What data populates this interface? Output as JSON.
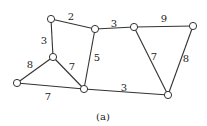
{
  "graph": {
    "caption": "(a)",
    "nodes": [
      {
        "id": "A"
      },
      {
        "id": "B"
      },
      {
        "id": "C"
      },
      {
        "id": "D"
      },
      {
        "id": "E"
      },
      {
        "id": "F"
      },
      {
        "id": "G"
      },
      {
        "id": "H"
      }
    ],
    "edges": [
      {
        "from": "A",
        "to": "B",
        "weight": "2"
      },
      {
        "from": "A",
        "to": "C",
        "weight": "3"
      },
      {
        "from": "B",
        "to": "F",
        "weight": "3"
      },
      {
        "from": "B",
        "to": "E",
        "weight": "5"
      },
      {
        "from": "C",
        "to": "D",
        "weight": "8"
      },
      {
        "from": "C",
        "to": "E",
        "weight": "7"
      },
      {
        "from": "D",
        "to": "E",
        "weight": "7"
      },
      {
        "from": "E",
        "to": "H",
        "weight": "3"
      },
      {
        "from": "F",
        "to": "G",
        "weight": "9"
      },
      {
        "from": "F",
        "to": "H",
        "weight": "7"
      },
      {
        "from": "G",
        "to": "H",
        "weight": "8"
      }
    ]
  }
}
